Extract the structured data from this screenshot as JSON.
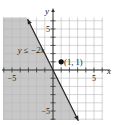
{
  "chart_data": {
    "type": "line",
    "title": "",
    "xlabel": "x",
    "ylabel": "y",
    "xlim": [
      -6.1,
      6.1
    ],
    "ylim": [
      -6.1,
      6.4
    ],
    "grid": true,
    "grid_step": 1,
    "x_tick_labels": [
      {
        "value": -5,
        "label": "−5"
      },
      {
        "value": 5,
        "label": "5"
      }
    ],
    "y_tick_labels": [
      {
        "value": 5,
        "label": "5"
      },
      {
        "value": -5,
        "label": "−5"
      }
    ],
    "boundary_line": {
      "equation": "y = -2x",
      "slope": -2,
      "intercept": 0,
      "style": "solid",
      "x_range": [
        -3.1,
        3.1
      ],
      "arrows": "both"
    },
    "shaded_region": {
      "inequality": "y ≤ −2x",
      "side": "below-left",
      "color": "#c8c8c8"
    },
    "annotations": [
      {
        "text": "y ≤ −2x",
        "x": -4.3,
        "y": 2.4,
        "italic": true
      },
      {
        "text": "(1, 1)",
        "x": 1.35,
        "y": 1,
        "italic": false
      }
    ],
    "points": [
      {
        "x": 1,
        "y": 1,
        "label": "(1, 1)"
      }
    ],
    "colors": {
      "grid": "#b8b8b8",
      "axis": "#333333",
      "line": "#222222",
      "shade": "#c8c8c8"
    }
  }
}
